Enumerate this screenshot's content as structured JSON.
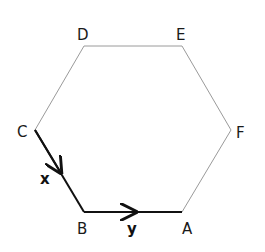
{
  "diagram": {
    "type": "regular-hexagon",
    "vertices": [
      {
        "name": "A",
        "x": 182,
        "y": 212
      },
      {
        "name": "B",
        "x": 84,
        "y": 212
      },
      {
        "name": "C",
        "x": 35,
        "y": 130
      },
      {
        "name": "D",
        "x": 84,
        "y": 46
      },
      {
        "name": "E",
        "x": 182,
        "y": 46
      },
      {
        "name": "F",
        "x": 231,
        "y": 130
      }
    ],
    "labels": {
      "A": "A",
      "B": "B",
      "C": "C",
      "D": "D",
      "E": "E",
      "F": "F"
    },
    "vectors": [
      {
        "name": "x",
        "label": "x",
        "from": "C",
        "to": "B"
      },
      {
        "name": "y",
        "label": "y",
        "from": "B",
        "to": "A"
      }
    ],
    "colors": {
      "edge": "#9a9a9a",
      "vector": "#111111",
      "label": "#1a1a1a"
    }
  }
}
